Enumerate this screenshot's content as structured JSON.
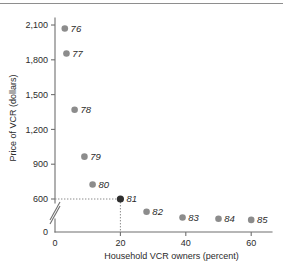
{
  "chart_data": {
    "type": "scatter",
    "title": "",
    "xlabel": "Household VCR owners (percent)",
    "ylabel": "Price of VCR (dollars)",
    "xlim": [
      0,
      65
    ],
    "ylim": [
      400,
      2200
    ],
    "grid": false,
    "legend": "none",
    "x_ticks": [
      "0",
      "20",
      "40",
      "60"
    ],
    "x_tick_values": [
      0,
      20,
      40,
      60
    ],
    "y_ticks": [
      "0",
      "600",
      "900",
      "1,200",
      "1,500",
      "1,800",
      "2,100"
    ],
    "y_tick_values": [
      0,
      600,
      900,
      1200,
      1500,
      1800,
      2100
    ],
    "y_axis_break": true,
    "y_axis_break_note": "axis broken between 0 and 600",
    "points": [
      {
        "label": "76",
        "x": 3,
        "y": 2070
      },
      {
        "label": "77",
        "x": 3.5,
        "y": 1855
      },
      {
        "label": "78",
        "x": 6,
        "y": 1370
      },
      {
        "label": "79",
        "x": 9,
        "y": 965
      },
      {
        "label": "80",
        "x": 11.5,
        "y": 725
      },
      {
        "label": "81",
        "x": 20,
        "y": 600,
        "highlighted": true
      },
      {
        "label": "82",
        "x": 28,
        "y": 490
      },
      {
        "label": "83",
        "x": 39,
        "y": 440
      },
      {
        "label": "84",
        "x": 50,
        "y": 430
      },
      {
        "label": "85",
        "x": 60,
        "y": 420
      }
    ],
    "annotations": [
      {
        "kind": "reference-lines",
        "x": 20,
        "y": 600,
        "style": "dotted"
      }
    ],
    "colors": {
      "point": "#8c8c8c",
      "point_highlighted": "#2e2e2e",
      "axis": "#6f6f6f",
      "text": "#2b2b2b",
      "guide": "#8a8a8a",
      "background": "#ffffff"
    }
  }
}
